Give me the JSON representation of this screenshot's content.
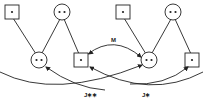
{
  "diagram": {
    "type": "node-link",
    "nodes": [
      {
        "id": "L-sq-top",
        "shape": "square",
        "dots": 1
      },
      {
        "id": "L-circ-top",
        "shape": "circle",
        "dots": 2
      },
      {
        "id": "L-circ-bottom",
        "shape": "circle",
        "dots": 2
      },
      {
        "id": "L-sq-bottom",
        "shape": "square",
        "dots": 1
      },
      {
        "id": "R-sq-top",
        "shape": "square",
        "dots": 1
      },
      {
        "id": "R-circ-top",
        "shape": "circle",
        "dots": 2
      },
      {
        "id": "R-circ-bottom",
        "shape": "circle",
        "dots": 2
      },
      {
        "id": "R-sq-bottom",
        "shape": "square",
        "dots": 1
      }
    ],
    "labels": {
      "m": "M",
      "j_double": "J∗∗",
      "j_single": "J∗"
    },
    "colors": {
      "stroke": "#222222",
      "background": "#ffffff"
    }
  }
}
